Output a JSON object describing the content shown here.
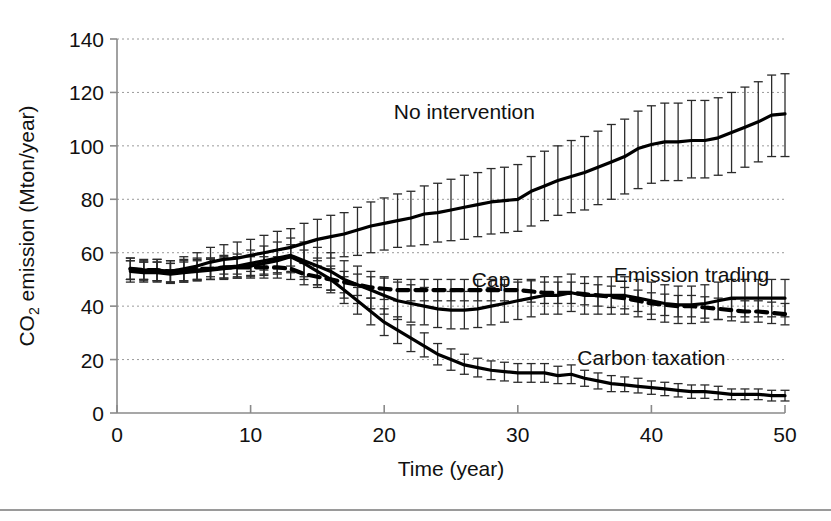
{
  "figure": {
    "title": "",
    "background_color": "#ffffff",
    "line_color": "#000000",
    "grid_color": "#9a9a9a",
    "axis_color": "#8a8a8a",
    "bottom_rule_color": "#9a9a9a"
  },
  "axes": {
    "y_title_parts": {
      "prefix": "CO",
      "subscript": "2",
      "suffix": " emission (Mton/year)"
    },
    "y_title": "CO2 emission (Mton/year)",
    "x_title": "Time (year)",
    "x_ticks": [
      "0",
      "10",
      "20",
      "30",
      "40",
      "50"
    ],
    "y_ticks": [
      "0",
      "20",
      "40",
      "60",
      "80",
      "100",
      "120",
      "140"
    ]
  },
  "labels": {
    "no_intervention": "No intervention",
    "emission_trading": "Emission trading",
    "cap": "Cap",
    "carbon_taxation": "Carbon taxation"
  },
  "chart_data": {
    "type": "line",
    "title": "",
    "xlabel": "Time (year)",
    "ylabel": "CO2 emission (Mton/year)",
    "xlim": [
      0,
      50
    ],
    "ylim": [
      0,
      140
    ],
    "xticks": [
      0,
      10,
      20,
      30,
      40,
      50
    ],
    "yticks": [
      0,
      20,
      40,
      60,
      80,
      100,
      120,
      140
    ],
    "grid": "horizontal-dotted",
    "legend": "inline-annotations",
    "errorbars": "vertical whisker bars at every data point",
    "x": [
      1,
      2,
      3,
      4,
      5,
      6,
      7,
      8,
      9,
      10,
      11,
      12,
      13,
      14,
      15,
      16,
      17,
      18,
      19,
      20,
      21,
      22,
      23,
      24,
      25,
      26,
      27,
      28,
      29,
      30,
      31,
      32,
      33,
      34,
      35,
      36,
      37,
      38,
      39,
      40,
      41,
      42,
      43,
      44,
      45,
      46,
      47,
      48,
      49,
      50
    ],
    "series": [
      {
        "name": "No intervention",
        "style": "solid",
        "label_x": 26,
        "label_y": 110,
        "values": [
          54,
          53.5,
          53.5,
          53,
          54,
          55,
          56.5,
          57.5,
          58,
          59,
          60,
          61,
          62,
          63.5,
          65,
          66,
          67,
          68.5,
          70,
          71,
          72,
          73,
          74.5,
          75,
          76,
          77,
          78,
          79,
          79.5,
          80,
          83,
          85,
          87,
          88.5,
          90,
          92,
          94,
          96,
          99,
          100.5,
          101.5,
          101.5,
          102,
          102,
          103,
          105,
          107,
          109,
          111.5,
          112
        ],
        "err_low": [
          50,
          50,
          49.5,
          49,
          49.5,
          50,
          51,
          52,
          52,
          53,
          53.5,
          54,
          55,
          56,
          57,
          58,
          58.5,
          59,
          60,
          61,
          62,
          62.5,
          63,
          64,
          64.5,
          65,
          66,
          67,
          67.5,
          68,
          70,
          72,
          74,
          75,
          76,
          78,
          80,
          82,
          84,
          86,
          87,
          87,
          88,
          88,
          89,
          90,
          92,
          94,
          96,
          96
        ],
        "err_high": [
          58,
          57.5,
          57.5,
          57,
          58.5,
          60,
          62,
          63,
          64,
          65,
          66.5,
          68,
          69,
          71,
          72.5,
          74,
          75,
          77,
          79,
          80.5,
          82,
          83,
          85,
          86,
          87.5,
          89,
          90,
          91.5,
          92,
          93,
          96,
          98,
          100,
          102,
          103.5,
          105.5,
          108,
          110,
          113,
          115,
          116,
          116,
          117,
          117,
          118,
          120,
          122,
          124,
          126.5,
          127
        ],
        "note": "rises steadily from ~54 to ~112 Mton/year"
      },
      {
        "name": "Emission trading",
        "style": "solid",
        "label_x": 43,
        "label_y": 49,
        "values": [
          53.5,
          53,
          53,
          52.5,
          53,
          53.5,
          54,
          54.5,
          55,
          56,
          57,
          58,
          59,
          57,
          55,
          53,
          50,
          48,
          46,
          44,
          42,
          41,
          40,
          39,
          38.5,
          38.5,
          39,
          40,
          41,
          42,
          43,
          44,
          44,
          45,
          44,
          44,
          44,
          44,
          43,
          42,
          41,
          40.5,
          40.5,
          41,
          42,
          43,
          43,
          43,
          43,
          43
        ],
        "err_low": [
          50,
          49.5,
          49.5,
          49,
          49,
          49.5,
          50,
          50,
          50.5,
          51,
          51.5,
          52,
          52.5,
          50,
          48,
          46,
          43,
          41,
          39,
          37,
          35,
          34,
          33,
          32,
          31.5,
          31.5,
          32,
          33,
          34,
          35,
          36,
          37,
          37,
          38,
          37,
          37,
          37,
          37,
          36,
          35,
          34,
          33.5,
          33.5,
          34,
          35,
          36,
          36,
          36,
          36,
          36
        ],
        "err_high": [
          57,
          56.5,
          56.5,
          56,
          57,
          57.5,
          58,
          59,
          59.5,
          61,
          62.5,
          64,
          65.5,
          64,
          62,
          60,
          57,
          55,
          53,
          51,
          49,
          48,
          47,
          46,
          45.5,
          45.5,
          46,
          47,
          48,
          49,
          50,
          51,
          51,
          52,
          51,
          51,
          51,
          51,
          50,
          49,
          48,
          47.5,
          47.5,
          48,
          49,
          50,
          50,
          50,
          50,
          50
        ],
        "note": "dips to ~38 near year 25 then recovers to ~43"
      },
      {
        "name": "Cap",
        "style": "dashed",
        "label_x": 28,
        "label_y": 47,
        "values": [
          54,
          53.5,
          53.5,
          53,
          53.5,
          54,
          54,
          54.5,
          54.5,
          54.5,
          54.5,
          54.5,
          54,
          52,
          51,
          50,
          49,
          48,
          47,
          46.5,
          46,
          46,
          46,
          46,
          46,
          46,
          46,
          46,
          46,
          46,
          45.5,
          45,
          45,
          45,
          44.5,
          44,
          43.5,
          43,
          42,
          41,
          40.5,
          40,
          40,
          39.5,
          39,
          38.5,
          38,
          38,
          37.5,
          37
        ],
        "err_low": [
          50,
          50,
          49.5,
          49,
          49.5,
          50,
          50,
          50.5,
          50.5,
          50.5,
          50.5,
          50.5,
          50,
          48,
          47,
          46,
          45,
          44,
          43,
          42.5,
          42,
          42,
          42,
          42,
          42,
          42,
          42,
          42,
          42,
          42,
          41.5,
          41,
          41,
          41,
          40.5,
          40,
          39.5,
          39,
          38,
          37,
          36.5,
          36,
          36,
          35.5,
          35,
          34.5,
          34,
          34,
          33.5,
          33
        ],
        "err_high": [
          58,
          57,
          57.5,
          57,
          57.5,
          58,
          58,
          58.5,
          58.5,
          58.5,
          58.5,
          58.5,
          58,
          56,
          55,
          54,
          53,
          52,
          51,
          50.5,
          50,
          50,
          50,
          50,
          50,
          50,
          50,
          50,
          50,
          50,
          49.5,
          49,
          49,
          49,
          48.5,
          48,
          47.5,
          47,
          46,
          45,
          44.5,
          44,
          44,
          43.5,
          43,
          42.5,
          42,
          42,
          41.5,
          41
        ],
        "note": "dashed line, flat near 54 then gentle decline to ~37"
      },
      {
        "name": "Carbon taxation",
        "style": "solid",
        "label_x": 40,
        "label_y": 18,
        "values": [
          53,
          52.5,
          52.5,
          52,
          52.5,
          53,
          53.5,
          54,
          54.5,
          55,
          56,
          57,
          58.5,
          56,
          53,
          50,
          46,
          42,
          38,
          34,
          31,
          28,
          25,
          22,
          20,
          18,
          17,
          16,
          15.5,
          15,
          15,
          15,
          14,
          14.5,
          13,
          12,
          11,
          10.5,
          10,
          9.5,
          9,
          8.5,
          8,
          8,
          7.5,
          7,
          7,
          7,
          6.5,
          6.5
        ],
        "err_low": [
          49,
          49,
          49,
          48.5,
          49,
          49.5,
          50,
          50.5,
          51,
          51.5,
          52,
          52.5,
          53,
          51,
          48,
          45,
          41,
          37,
          33,
          29,
          26,
          23,
          21,
          18,
          16,
          14.5,
          13.5,
          12.5,
          12,
          11.5,
          11.5,
          11.5,
          11,
          11,
          10,
          9,
          8,
          8,
          7.5,
          7,
          6.5,
          6,
          5.5,
          5.5,
          5,
          5,
          5,
          5,
          4.5,
          4.5
        ],
        "err_high": [
          57,
          56.5,
          56.5,
          56,
          56.5,
          57,
          57.5,
          58,
          58.5,
          59,
          60,
          61,
          63,
          61,
          58,
          55,
          51,
          47,
          43,
          39,
          36,
          33,
          30,
          26,
          24,
          22,
          20.5,
          19.5,
          19,
          18.5,
          18.5,
          18.5,
          17.5,
          18,
          16,
          15,
          14,
          13.5,
          13,
          12,
          11.5,
          11,
          10.5,
          10.5,
          10,
          9,
          9,
          9,
          8.5,
          8.5
        ],
        "note": "steep decline after year 13 down to ~6.5"
      }
    ]
  }
}
